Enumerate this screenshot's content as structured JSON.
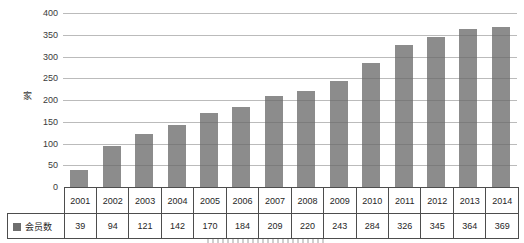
{
  "chart_data": {
    "type": "bar",
    "title": "",
    "categories": [
      "2001",
      "2002",
      "2003",
      "2004",
      "2005",
      "2006",
      "2007",
      "2008",
      "2009",
      "2010",
      "2011",
      "2012",
      "2013",
      "2014"
    ],
    "series": [
      {
        "name": "会员数",
        "values": [
          39,
          94,
          121,
          142,
          170,
          184,
          209,
          220,
          243,
          284,
          326,
          345,
          364,
          369
        ]
      }
    ],
    "xlabel": "",
    "ylabel": "家",
    "ylim": [
      0,
      400
    ],
    "ytick_step": 50,
    "grid": true,
    "legend_position": "data-table-left",
    "data_table_attached": true,
    "colors": {
      "bar": "#8c8c8c",
      "gridline": "#a6a6a6",
      "axis_and_table_border": "#4d4d4d",
      "text": "#2e2e2e",
      "legend_marker": "#6e6e6e",
      "background": "#ffffff"
    }
  }
}
